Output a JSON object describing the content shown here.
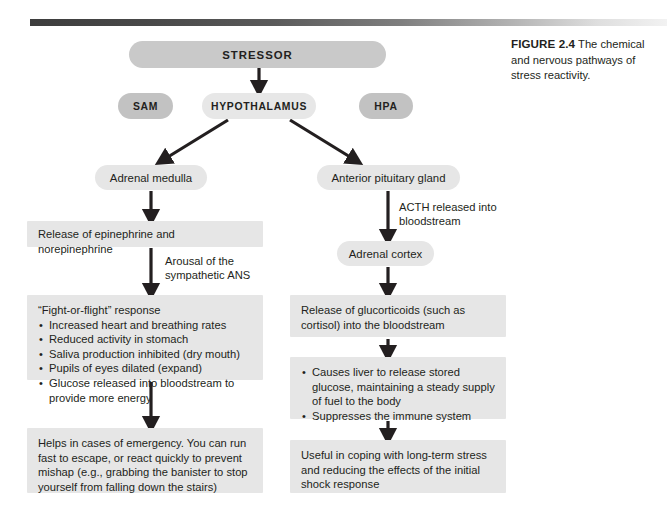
{
  "figure": {
    "label": "FIGURE 2.4",
    "caption": "The chemical and nervous pathways of stress reactivity."
  },
  "colors": {
    "node_fill_dark": "#c2c2c2",
    "node_fill_stressor": "#c9c9c9",
    "node_fill_light": "#e6e6e6",
    "box_fill": "#e6e6e6",
    "arrow": "#231f20",
    "text": "#231f20",
    "rule_start": "#3d3d3d",
    "rule_end": "#f2f2f2"
  },
  "nodes": {
    "stressor": "STRESSOR",
    "sam": "SAM",
    "hypothalamus": "HYPOTHALAMUS",
    "hpa": "HPA",
    "adrenal_medulla": "Adrenal medulla",
    "anterior_pituitary": "Anterior pituitary gland",
    "adrenal_cortex": "Adrenal cortex"
  },
  "edge_labels": {
    "arousal": "Arousal of the sympathetic ANS",
    "acth": "ACTH released into bloodstream"
  },
  "boxes": {
    "epinephrine": {
      "text": "Release of epinephrine and norepinephrine"
    },
    "fight_flight": {
      "title": "“Fight-or-flight” response",
      "bullets": [
        "Increased heart and breathing rates",
        "Reduced activity in stomach",
        "Saliva production inhibited (dry mouth)",
        "Pupils of eyes dilated (expand)",
        "Glucose released into bloodstream to provide more energy"
      ]
    },
    "helps": {
      "text": "Helps in cases of emergency. You can run fast to escape, or react quickly to prevent mishap (e.g., grabbing the banister to stop yourself from falling down the stairs)"
    },
    "glucocorticoids": {
      "text": "Release of glucorticoids (such as cortisol) into the bloodstream"
    },
    "causes_liver": {
      "bullets": [
        "Causes liver to release stored glucose, maintaining a steady supply of fuel to the body",
        "Suppresses the immune system"
      ]
    },
    "useful": {
      "text": "Useful in coping with long-term stress and reducing the effects of the initial shock response"
    }
  },
  "icons": {
    "arrow_down": "arrow-down-icon",
    "arrow_diagonal_left": "arrow-down-left-icon",
    "arrow_diagonal_right": "arrow-down-right-icon"
  }
}
